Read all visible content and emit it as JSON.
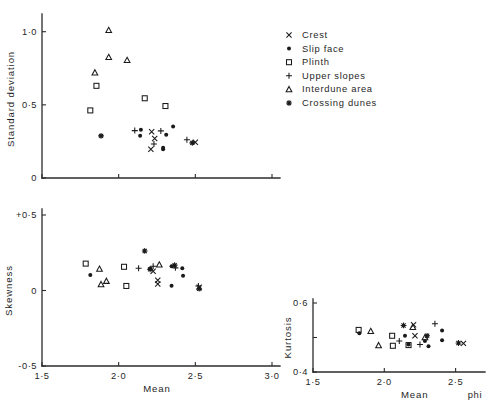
{
  "figure": {
    "title": "",
    "background": "#ffffff",
    "ink_color": "#1a1a1a"
  },
  "legend": {
    "position": "top-right",
    "entries": [
      {
        "label": "Crest",
        "marker": "cross-x",
        "symbol": "x"
      },
      {
        "label": "Slip  face",
        "marker": "filled-circle",
        "symbol": "●"
      },
      {
        "label": "Plinth",
        "marker": "open-square",
        "symbol": "□"
      },
      {
        "label": "Upper  slopes",
        "marker": "plus",
        "symbol": "+"
      },
      {
        "label": "Interdune   area",
        "marker": "open-triangle",
        "symbol": "△"
      },
      {
        "label": "Crossing  dunes",
        "marker": "asterisk",
        "symbol": "✹"
      }
    ]
  },
  "chart_data": [
    {
      "id": "standard-deviation-vs-mean",
      "type": "scatter",
      "title": "",
      "xlabel": "",
      "ylabel": "Standard  deviation",
      "xlim": [
        1.5,
        3.0
      ],
      "ylim": [
        0.0,
        1.08
      ],
      "xticks": [
        1.5,
        2.0,
        2.5,
        3.0
      ],
      "xticklabels": [
        "",
        "",
        "",
        ""
      ],
      "yticks": [
        0.0,
        0.5,
        1.0
      ],
      "yticklabels": [
        "0",
        "0·5",
        "1·0"
      ],
      "grid": false,
      "series": [
        {
          "name": "Crest",
          "marker": "cross-x",
          "points": [
            [
              2.215,
              0.316
            ],
            [
              2.235,
              0.27
            ],
            [
              2.21,
              0.196
            ],
            [
              2.5,
              0.244
            ]
          ]
        },
        {
          "name": "Slip  face",
          "marker": "filled-circle",
          "points": [
            [
              2.145,
              0.33
            ],
            [
              2.14,
              0.288
            ],
            [
              2.31,
              0.296
            ],
            [
              2.355,
              0.352
            ],
            [
              2.29,
              0.206
            ],
            [
              2.29,
              0.196
            ]
          ]
        },
        {
          "name": "Plinth",
          "marker": "open-square",
          "points": [
            [
              1.815,
              0.462
            ],
            [
              1.855,
              0.63
            ],
            [
              2.17,
              0.545
            ],
            [
              2.305,
              0.492
            ]
          ]
        },
        {
          "name": "Upper  slopes",
          "marker": "plus",
          "points": [
            [
              2.105,
              0.324
            ],
            [
              2.275,
              0.322
            ],
            [
              2.23,
              0.233
            ],
            [
              2.445,
              0.262
            ]
          ]
        },
        {
          "name": "Interdune   area",
          "marker": "open-triangle",
          "points": [
            [
              1.845,
              0.72
            ],
            [
              1.935,
              1.01
            ],
            [
              1.935,
              0.825
            ],
            [
              2.055,
              0.805
            ]
          ]
        },
        {
          "name": "Crossing  dunes",
          "marker": "asterisk",
          "points": [
            [
              1.885,
              0.288
            ],
            [
              2.48,
              0.24
            ]
          ]
        }
      ]
    },
    {
      "id": "skewness-vs-mean",
      "type": "scatter",
      "title": "",
      "xlabel": "Mean",
      "ylabel": "Skewness",
      "xlim": [
        1.5,
        3.0
      ],
      "ylim": [
        -0.5,
        0.5
      ],
      "xticks": [
        1.5,
        2.0,
        2.5,
        3.0
      ],
      "xticklabels": [
        "1·5",
        "2·0",
        "2·5",
        "3·0"
      ],
      "yticks": [
        -0.5,
        0.0,
        0.5
      ],
      "yticklabels": [
        "-0·5",
        "0",
        "+0·5"
      ],
      "grid": false,
      "series": [
        {
          "name": "Crest",
          "marker": "cross-x",
          "points": [
            [
              2.225,
              0.128
            ],
            [
              2.255,
              0.068
            ],
            [
              2.255,
              0.043
            ],
            [
              2.525,
              0.022
            ]
          ]
        },
        {
          "name": "Slip  face",
          "marker": "filled-circle",
          "points": [
            [
              1.815,
              0.103
            ],
            [
              2.205,
              0.145
            ],
            [
              2.345,
              0.16
            ],
            [
              2.415,
              0.148
            ],
            [
              2.42,
              0.097
            ],
            [
              2.345,
              0.032
            ]
          ]
        },
        {
          "name": "Plinth",
          "marker": "open-square",
          "points": [
            [
              1.785,
              0.178
            ],
            [
              2.035,
              0.157
            ],
            [
              2.05,
              0.03
            ]
          ]
        },
        {
          "name": "Upper  slopes",
          "marker": "plus",
          "points": [
            [
              2.13,
              0.148
            ],
            [
              2.225,
              0.16
            ],
            [
              2.37,
              0.15
            ],
            [
              2.52,
              0.03
            ]
          ]
        },
        {
          "name": "Interdune   area",
          "marker": "open-triangle",
          "points": [
            [
              1.875,
              0.142
            ],
            [
              1.92,
              0.062
            ],
            [
              1.885,
              0.04
            ],
            [
              2.265,
              0.17
            ]
          ]
        },
        {
          "name": "Crossing  dunes",
          "marker": "asterisk",
          "points": [
            [
              2.17,
              0.262
            ],
            [
              2.205,
              0.14
            ],
            [
              2.365,
              0.168
            ],
            [
              2.525,
              0.012
            ]
          ]
        }
      ]
    },
    {
      "id": "kurtosis-vs-mean",
      "type": "scatter",
      "title": "",
      "xlabel": "Mean",
      "xlabel_unit": "phi",
      "ylabel": "Kurtosis",
      "xlim": [
        1.5,
        2.65
      ],
      "ylim": [
        0.4,
        0.6
      ],
      "xticks": [
        1.5,
        2.0,
        2.5
      ],
      "xticklabels": [
        "1·5",
        "2·0",
        "2·5"
      ],
      "yticks": [
        0.4,
        0.5,
        0.6
      ],
      "yticklabels": [
        "0·4",
        "",
        "0·6"
      ],
      "grid": false,
      "series": [
        {
          "name": "Crest",
          "marker": "cross-x",
          "points": [
            [
              2.205,
              0.537
            ],
            [
              2.215,
              0.505
            ],
            [
              2.555,
              0.483
            ]
          ]
        },
        {
          "name": "Slip  face",
          "marker": "filled-circle",
          "points": [
            [
              1.825,
              0.512
            ],
            [
              2.145,
              0.505
            ],
            [
              2.17,
              0.48
            ],
            [
              2.285,
              0.49
            ],
            [
              2.31,
              0.475
            ],
            [
              2.405,
              0.52
            ],
            [
              2.405,
              0.492
            ]
          ]
        },
        {
          "name": "Plinth",
          "marker": "open-square",
          "points": [
            [
              1.82,
              0.522
            ],
            [
              2.055,
              0.505
            ],
            [
              2.06,
              0.476
            ],
            [
              2.17,
              0.478
            ]
          ]
        },
        {
          "name": "Upper  slopes",
          "marker": "plus",
          "points": [
            [
              2.105,
              0.49
            ],
            [
              2.25,
              0.48
            ],
            [
              2.355,
              0.54
            ]
          ]
        },
        {
          "name": "Interdune   area",
          "marker": "open-triangle",
          "points": [
            [
              1.905,
              0.518
            ],
            [
              1.96,
              0.477
            ],
            [
              2.2,
              0.53
            ],
            [
              2.285,
              0.5
            ]
          ]
        },
        {
          "name": "Crossing  dunes",
          "marker": "asterisk",
          "points": [
            [
              2.135,
              0.535
            ],
            [
              2.3,
              0.505
            ],
            [
              2.52,
              0.484
            ]
          ]
        }
      ]
    }
  ]
}
